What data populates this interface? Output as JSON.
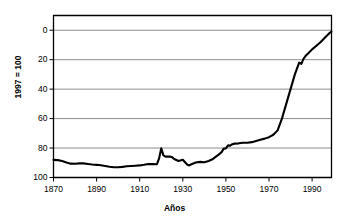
{
  "chart_data": {
    "type": "line",
    "title": "",
    "xlabel": "Años",
    "ylabel": "1997 = 100",
    "xlim": [
      1870,
      1999
    ],
    "ylim": [
      0,
      110
    ],
    "xticks": [
      1870,
      1890,
      1910,
      1930,
      1950,
      1970,
      1990
    ],
    "yticks": [
      0,
      20,
      40,
      60,
      80,
      100
    ],
    "grid": "horizontal",
    "legend": "none",
    "line_color": "#000000",
    "grid_color": "#808080",
    "axis_color": "#000000",
    "background": "#ffffff",
    "series": [
      {
        "name": "Índice (1997 = 100)",
        "x": [
          1870,
          1872,
          1874,
          1876,
          1878,
          1880,
          1882,
          1884,
          1886,
          1888,
          1890,
          1892,
          1894,
          1896,
          1898,
          1900,
          1902,
          1904,
          1906,
          1908,
          1910,
          1912,
          1914,
          1916,
          1918,
          1919,
          1920,
          1921,
          1922,
          1923,
          1924,
          1925,
          1926,
          1928,
          1930,
          1932,
          1933,
          1934,
          1936,
          1938,
          1940,
          1942,
          1944,
          1946,
          1948,
          1949,
          1950,
          1951,
          1952,
          1953,
          1954,
          1956,
          1958,
          1960,
          1962,
          1964,
          1966,
          1968,
          1970,
          1972,
          1974,
          1976,
          1978,
          1980,
          1982,
          1984,
          1985,
          1986,
          1987,
          1988,
          1990,
          1992,
          1994,
          1996,
          1998,
          1999
        ],
        "y": [
          12.0,
          11.8,
          11.2,
          10.2,
          9.4,
          9.3,
          9.6,
          9.6,
          9.2,
          8.8,
          8.6,
          8.3,
          7.8,
          7.3,
          7.0,
          7.0,
          7.2,
          7.6,
          7.8,
          8.0,
          8.2,
          8.6,
          9.2,
          9.1,
          9.0,
          13.0,
          19.8,
          15.0,
          14.2,
          14.3,
          14.2,
          13.8,
          12.6,
          11.2,
          12.0,
          8.8,
          8.2,
          9.0,
          10.2,
          10.6,
          10.4,
          11.2,
          12.6,
          14.8,
          17.2,
          19.6,
          19.8,
          21.8,
          21.6,
          22.6,
          23.0,
          23.2,
          23.6,
          23.6,
          24.0,
          24.8,
          25.6,
          26.4,
          27.4,
          29.0,
          32.0,
          40.0,
          50.0,
          60.0,
          70.0,
          78.0,
          77.2,
          80.6,
          82.6,
          84.0,
          87.0,
          89.5,
          92.0,
          95.0,
          98.0,
          99.0
        ]
      }
    ]
  },
  "axis": {
    "y_tick_labels": [
      "100",
      "80",
      "60",
      "40",
      "20",
      "0"
    ],
    "x_tick_labels": [
      "1870",
      "1890",
      "1910",
      "1930",
      "1950",
      "1970",
      "1990"
    ],
    "y_axis_title": "1997 = 100",
    "x_axis_title": "Años"
  }
}
